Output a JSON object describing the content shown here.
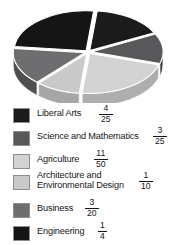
{
  "chart_data": {
    "type": "pie",
    "title": "",
    "xlabel": "",
    "ylabel": "",
    "style": "3d-pie-grayscale",
    "legend_position": "bottom",
    "grid": false,
    "categories": [
      "Liberal Arts",
      "Science and Mathematics",
      "Agriculture",
      "Architecture and Environmental Design",
      "Business",
      "Engineering"
    ],
    "labels_multiline": [
      "Liberal Arts",
      "Science and Mathematics",
      "Agriculture",
      "Architecture and\nEnvironmental Design",
      "Business",
      "Engineering"
    ],
    "fractions": [
      "4/25",
      "3/25",
      "11/50",
      "1/10",
      "3/20",
      "1/4"
    ],
    "numerators": [
      4,
      3,
      11,
      1,
      3,
      1
    ],
    "denominators": [
      25,
      25,
      50,
      10,
      20,
      4
    ],
    "values": [
      0.16,
      0.12,
      0.22,
      0.1,
      0.15,
      0.25
    ],
    "percentages": [
      16,
      12,
      22,
      10,
      15,
      25
    ],
    "colors": [
      "#1b1b1b",
      "#58585a",
      "#d3d3d3",
      "#c9c9c9",
      "#6e6e70",
      "#151515"
    ],
    "side_colors": [
      "#0e0e0e",
      "#3e3e40",
      "#aeaeae",
      "#a6a6a6",
      "#4f4f51",
      "#0a0a0a"
    ],
    "start_angle_deg": -84,
    "direction": "clockwise"
  },
  "legend": {
    "items": [
      {
        "label": "Liberal Arts",
        "fraction_numerator": "4",
        "fraction_denominator": "25",
        "color": "#1b1b1b"
      },
      {
        "label": "Science and Mathematics",
        "fraction_numerator": "3",
        "fraction_denominator": "25",
        "color": "#58585a"
      },
      {
        "label": "Agriculture",
        "fraction_numerator": "11",
        "fraction_denominator": "50",
        "color": "#d3d3d3"
      },
      {
        "label": "Architecture and\nEnvironmental Design",
        "fraction_numerator": "1",
        "fraction_denominator": "10",
        "color": "#c9c9c9"
      },
      {
        "label": "Business",
        "fraction_numerator": "3",
        "fraction_denominator": "20",
        "color": "#6e6e70"
      },
      {
        "label": "Engineering",
        "fraction_numerator": "1",
        "fraction_denominator": "4",
        "color": "#151515"
      }
    ]
  },
  "layout": {
    "legend_rows_top": [
      4,
      27,
      50,
      71,
      99,
      122
    ],
    "legend_label_top": [
      4,
      27,
      50,
      66,
      99,
      122
    ],
    "legend_frac_left": [
      99,
      153,
      94,
      139,
      85,
      98
    ],
    "legend_frac_top": [
      0,
      22,
      45,
      67,
      94,
      117
    ],
    "swatch_top": [
      4,
      27,
      50,
      71,
      99,
      122
    ]
  }
}
